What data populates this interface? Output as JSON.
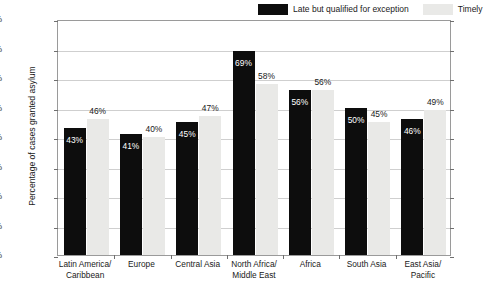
{
  "chart_data": {
    "type": "bar",
    "title": "",
    "subtitle": "",
    "xlabel": "",
    "ylabel": "Percentage of cases granted asylum",
    "ylim": [
      0,
      80
    ],
    "ytick_labels": [
      "0%",
      "10%",
      "20%",
      "30%",
      "40%",
      "50%",
      "60%",
      "70%",
      "80%"
    ],
    "ytick_values": [
      0,
      10,
      20,
      30,
      40,
      50,
      60,
      70,
      80
    ],
    "grid": true,
    "legend_position": "top-right",
    "categories": [
      "Latin America/\nCaribbean",
      "Europe",
      "Central Asia",
      "North Africa/\nMiddle East",
      "Africa",
      "South Asia",
      "East Asia/\nPacific"
    ],
    "category_lines": [
      [
        "Latin America/",
        "Caribbean"
      ],
      [
        "Europe"
      ],
      [
        "Central Asia"
      ],
      [
        "North Africa/",
        "Middle East"
      ],
      [
        "Africa"
      ],
      [
        "South Asia"
      ],
      [
        "East Asia/",
        "Pacific"
      ]
    ],
    "series": [
      {
        "name": "Late but qualified for exception",
        "color": "#0d0d0d",
        "values": [
          43,
          41,
          45,
          69,
          56,
          50,
          46
        ],
        "labels": [
          "43%",
          "41%",
          "45%",
          "69%",
          "56%",
          "50%",
          "46%"
        ]
      },
      {
        "name": "Timely",
        "color": "#e9e9e7",
        "values": [
          46,
          40,
          47,
          58,
          56,
          45,
          49
        ],
        "labels": [
          "46%",
          "40%",
          "47%",
          "58%",
          "56%",
          "45%",
          "49%"
        ]
      }
    ]
  },
  "legend": {
    "items": [
      {
        "label": "Late but qualified for exception",
        "swatch": "dark"
      },
      {
        "label": "Timely",
        "swatch": "light"
      }
    ]
  },
  "colors": {
    "series_dark": "#0d0d0d",
    "series_light": "#e9e9e7",
    "gridline": "#cfcfcf",
    "axis": "#9a9a9a",
    "text": "#1a1a1a",
    "background": "#ffffff"
  }
}
